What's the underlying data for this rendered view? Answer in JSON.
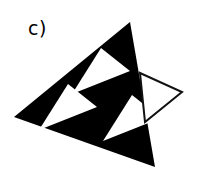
{
  "figure": {
    "panel_label": "c)",
    "caption": "",
    "background_color": "#ffffff",
    "ink_color": "#000000",
    "outline_color": "#111111",
    "outline_stroke_width": 2,
    "shapes": {
      "main_triangle": {
        "name": "large-filled-triangle",
        "fill": "#000000",
        "points": "130,22 14,117 155,167"
      },
      "white_sub_triangles": [
        {
          "name": "white-triangle-top",
          "fill": "#ffffff",
          "points": "130,71 101,48 72,94"
        },
        {
          "name": "white-triangle-left",
          "fill": "#ffffff",
          "points": "97,107 68,84 39,130"
        },
        {
          "name": "white-triangle-right",
          "fill": "#ffffff",
          "points": "161,118 132,95 103,141"
        }
      ],
      "outline_triangle": {
        "name": "unfilled-outlined-triangle",
        "fill": "none",
        "stroke": "#111111",
        "points": "140,73 182,92 145,122"
      }
    }
  }
}
